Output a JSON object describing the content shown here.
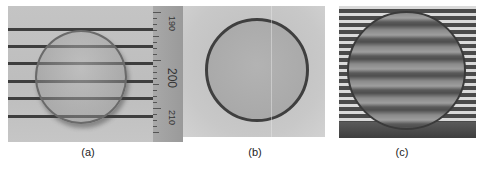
{
  "figure": {
    "panels": [
      {
        "id": "a",
        "caption": "(a)",
        "description": "Droplet on striped background with ruler",
        "stripes_y": [
          22,
          39,
          56,
          74,
          91,
          109
        ],
        "ruler": {
          "labels": [
            "190",
            "200",
            "210"
          ],
          "major_label": "200"
        }
      },
      {
        "id": "b",
        "caption": "(b)",
        "description": "Droplet top view with dark rim"
      },
      {
        "id": "c",
        "caption": "(c)",
        "description": "Droplet over fine fringe pattern showing distorted fringes"
      }
    ]
  }
}
